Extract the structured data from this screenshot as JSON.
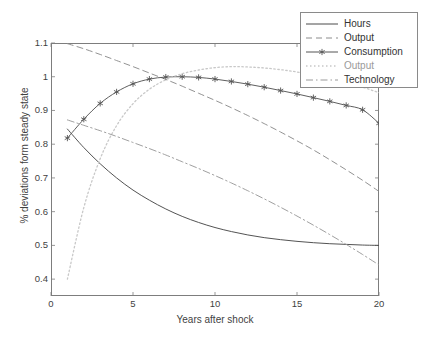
{
  "chart_data": {
    "type": "line",
    "title": "",
    "xlabel": "Years after shock",
    "ylabel": "% deviations form steady state",
    "xlim": [
      0,
      20
    ],
    "ylim": [
      0.35,
      1.1
    ],
    "xticks": [
      0,
      5,
      10,
      15,
      20
    ],
    "yticks": [
      0.4,
      0.5,
      0.6,
      0.7,
      0.8,
      0.9,
      1.0,
      1.1
    ],
    "ytick_labels": [
      "0.4",
      "0.5",
      "0.6",
      "0.7",
      "0.8",
      "0.9",
      "1",
      "1.1"
    ],
    "xtick_labels": [
      "0",
      "5",
      "10",
      "15",
      "20"
    ],
    "grid": false,
    "legend_position": "top-right",
    "x": [
      1,
      2,
      3,
      4,
      5,
      6,
      7,
      8,
      9,
      10,
      11,
      12,
      13,
      14,
      15,
      16,
      17,
      18,
      19,
      20
    ],
    "series": [
      {
        "name": "Hours",
        "style": "solid",
        "color": "#4a4a4a",
        "marker": "none",
        "values": [
          0.845,
          0.79,
          0.742,
          0.7,
          0.664,
          0.634,
          0.608,
          0.586,
          0.568,
          0.553,
          0.541,
          0.531,
          0.523,
          0.517,
          0.512,
          0.508,
          0.505,
          0.503,
          0.501,
          0.5
        ]
      },
      {
        "name": "Output",
        "style": "dashed",
        "color": "#8c8c8c",
        "marker": "none",
        "values": [
          1.098,
          1.083,
          1.066,
          1.048,
          1.03,
          1.011,
          0.992,
          0.972,
          0.951,
          0.93,
          0.908,
          0.885,
          0.861,
          0.836,
          0.81,
          0.783,
          0.754,
          0.724,
          0.693,
          0.66
        ]
      },
      {
        "name": "Consumption",
        "style": "solid",
        "color": "#555555",
        "marker": "star",
        "values": [
          0.818,
          0.874,
          0.921,
          0.955,
          0.979,
          0.993,
          0.999,
          1.0,
          0.998,
          0.993,
          0.986,
          0.978,
          0.969,
          0.959,
          0.949,
          0.938,
          0.927,
          0.915,
          0.902,
          0.862
        ]
      },
      {
        "name": "Output",
        "style": "dotted",
        "color": "#c8c8c8",
        "marker": "none",
        "values": [
          0.4,
          0.612,
          0.757,
          0.855,
          0.92,
          0.963,
          0.991,
          1.009,
          1.02,
          1.027,
          1.03,
          1.029,
          1.026,
          1.021,
          1.014,
          1.005,
          0.995,
          0.983,
          0.969,
          0.953
        ]
      },
      {
        "name": "Technology",
        "style": "dashdot",
        "color": "#9a9a9a",
        "marker": "none",
        "values": [
          0.872,
          0.856,
          0.84,
          0.823,
          0.805,
          0.787,
          0.768,
          0.748,
          0.728,
          0.707,
          0.685,
          0.662,
          0.638,
          0.613,
          0.587,
          0.56,
          0.532,
          0.503,
          0.473,
          0.442
        ]
      }
    ]
  },
  "legend": {
    "items": [
      {
        "label": "Hours"
      },
      {
        "label": "Output"
      },
      {
        "label": "Consumption"
      },
      {
        "label": "Output"
      },
      {
        "label": "Technology"
      }
    ]
  }
}
